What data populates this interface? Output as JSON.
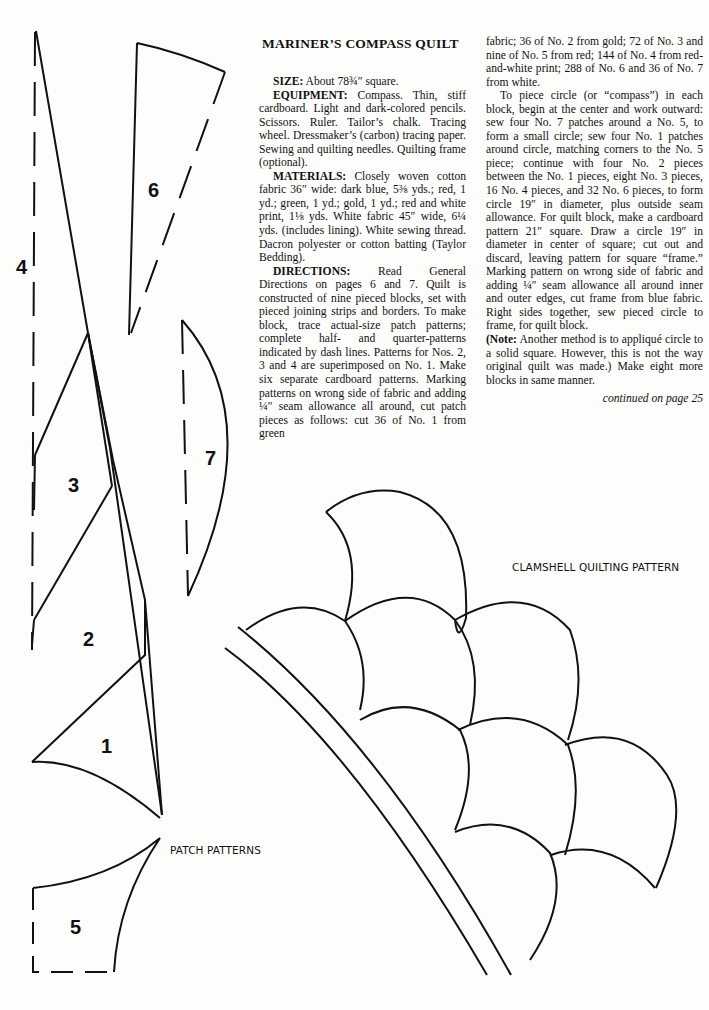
{
  "article": {
    "title": "MARINER’S COMPASS QUILT",
    "size_label": "SIZE:",
    "size_text": " About 78¾″ square.",
    "equipment_label": "EQUIPMENT:",
    "equipment_text": " Compass. Thin, stiff cardboard. Light and dark-colored pencils. Scissors. Ruler. Tailor’s chalk. Tracing wheel. Dressmaker’s (carbon) tracing paper. Sewing and quilting needles. Quilting frame (optional).",
    "materials_label": "MATERIALS:",
    "materials_text": " Closely woven cotton fabric 36″ wide: dark blue, 5⅜ yds.; red, 1 yd.; green, 1 yd.; gold, 1 yd.; red and white print, 1⅛ yds. White fabric 45″ wide, 6¼ yds. (includes lining). White sewing thread. Dacron polyester or cotton batting (Taylor Bedding).",
    "directions_label": "DIRECTIONS:",
    "directions_text": " Read General Directions on pages 6 and 7. Quilt is constructed of nine pieced blocks, set with pieced joining strips and borders. To make block, trace actual-size patch patterns; complete half- and quarter-patterns indicated by dash lines. Patterns for Nos. 2, 3 and 4 are superimposed on No. 1. Make six separate cardboard patterns. Marking patterns on wrong side of fabric and adding ¼″ seam allowance all around, cut patch pieces as follows: cut 36 of No. 1 from green",
    "directions_cont": "fabric; 36 of No. 2 from gold; 72 of No. 3 and nine of No. 5 from red; 144 of No. 4 from red-and-white print; 288 of No. 6 and 36 of No. 7 from white.",
    "piece_text": "To piece circle (or “compass”) in each block, begin at the center and work outward: sew four No. 7 patches around a No. 5, to form a small circle; sew four No. 1 patches around circle, matching corners to the No. 5 piece; continue with four No. 2 pieces between the No. 1 pieces, eight No. 3 pieces, 16 No. 4 pieces, and 32 No. 6 pieces, to form circle 19″ in diameter, plus outside seam allowance. For quilt block, make a cardboard pattern 21″ square. Draw a circle 19″ in diameter in center of square; cut out and discard, leaving pattern for square “frame.” Marking pattern on wrong side of fabric and adding ¼″ seam allowance all around inner and outer edges, cut frame from blue fabric. Right sides together, sew pieced circle to frame, for quilt block.",
    "note_label": "(Note:",
    "note_text": " Another method is to appliqué circle to a solid square. However, this is not the way original quilt was made.) Make eight more blocks in same manner.",
    "continued": "continued on page 25"
  },
  "figures": {
    "patch_patterns_caption": "PATCH PATTERNS",
    "clamshell_caption": "CLAMSHELL QUILTING PATTERN",
    "patch_numbers": {
      "p1": "1",
      "p2": "2",
      "p3": "3",
      "p4": "4",
      "p5": "5",
      "p6": "6",
      "p7": "7"
    }
  }
}
